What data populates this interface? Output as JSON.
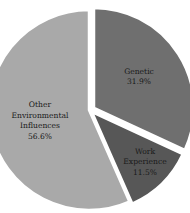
{
  "chart_data": {
    "type": "pie",
    "title": "",
    "start_angle_deg": 0,
    "direction": "clockwise",
    "exploded": true,
    "categories": [
      "Genetic",
      "Work Experience",
      "Other Environmental Influences"
    ],
    "values": [
      31.9,
      11.5,
      56.6
    ],
    "unit": "%",
    "slices": [
      {
        "label": "Genetic",
        "label_lines": [
          "Genetic"
        ],
        "value": 31.9,
        "value_label": "31.9%",
        "color": "#6f6f6f"
      },
      {
        "label": "Work Experience",
        "label_lines": [
          "Work",
          "Experience"
        ],
        "value": 11.5,
        "value_label": "11.5%",
        "color": "#575757"
      },
      {
        "label": "Other Environmental Influences",
        "label_lines": [
          "Other",
          "Environmental",
          "Influences"
        ],
        "value": 56.6,
        "value_label": "56.6%",
        "color": "#a9a9a9"
      }
    ],
    "legend": "none",
    "labels_inside": true
  }
}
